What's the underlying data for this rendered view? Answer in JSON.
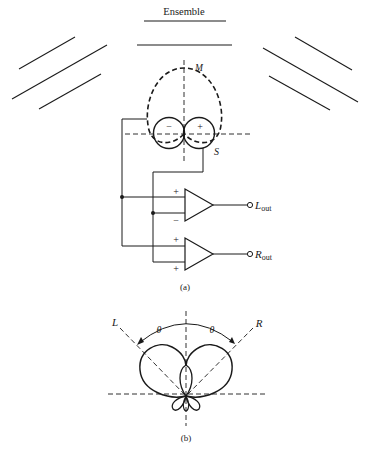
{
  "figure": {
    "ensemble_label": "Ensemble",
    "part_a": {
      "caption": "(a)",
      "pattern_labels": {
        "mid": "M",
        "side": "S"
      },
      "side_lobe_signs": {
        "left": "−",
        "right": "+"
      },
      "amplifiers": [
        {
          "inputs": [
            "+",
            "−"
          ],
          "output_label_main": "L",
          "output_label_sub": "out"
        },
        {
          "inputs": [
            "+",
            "+"
          ],
          "output_label_main": "R",
          "output_label_sub": "out"
        }
      ]
    },
    "part_b": {
      "caption": "(b)",
      "axis_labels": {
        "left": "L",
        "right": "R"
      },
      "angle_labels": [
        "θ",
        "θ"
      ]
    }
  },
  "colors": {
    "ink": "#1a1a1a",
    "background": "#ffffff"
  }
}
